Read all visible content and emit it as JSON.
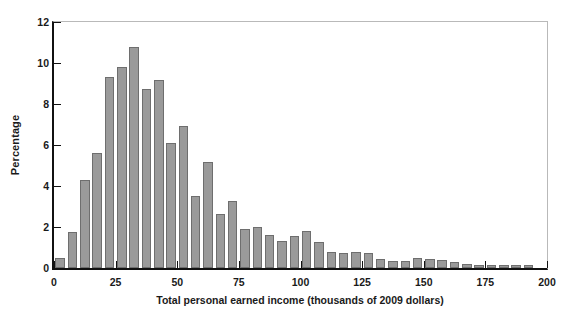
{
  "figure": {
    "caption": ""
  },
  "axes": {
    "ylabel": "Percentage",
    "xlabel": "Total personal earned income (thousands of 2009 dollars)",
    "yticks": [
      "0",
      "2",
      "4",
      "6",
      "8",
      "10",
      "12"
    ],
    "xticks": [
      "0",
      "25",
      "50",
      "75",
      "100",
      "125",
      "150",
      "175",
      "200"
    ]
  },
  "style": {
    "bar_fill": "#9a9a9a",
    "bar_edge": "#6e6e6e",
    "axis_color": "#111111",
    "frame_light": "#b9b9b9",
    "background": "#ffffff"
  },
  "chart_data": {
    "type": "bar",
    "title": "",
    "subtitle": "",
    "xlabel": "Total personal earned income (thousands of 2009 dollars)",
    "ylabel": "Percentage",
    "xlim": [
      0,
      200
    ],
    "ylim": [
      0,
      12
    ],
    "grid": false,
    "legend": null,
    "bin_width": 5,
    "bin_starts": [
      0,
      5,
      10,
      15,
      20,
      25,
      30,
      35,
      40,
      45,
      50,
      55,
      60,
      65,
      70,
      75,
      80,
      85,
      90,
      95,
      100,
      105,
      110,
      115,
      120,
      125,
      130,
      135,
      140,
      145,
      150,
      155,
      160,
      165,
      170,
      175,
      180,
      185,
      190,
      195
    ],
    "categories": [
      "0-5",
      "5-10",
      "10-15",
      "15-20",
      "20-25",
      "25-30",
      "30-35",
      "35-40",
      "40-45",
      "45-50",
      "50-55",
      "55-60",
      "60-65",
      "65-70",
      "70-75",
      "75-80",
      "80-85",
      "85-90",
      "90-95",
      "95-100",
      "100-105",
      "105-110",
      "110-115",
      "115-120",
      "120-125",
      "125-130",
      "130-135",
      "135-140",
      "140-145",
      "145-150",
      "150-155",
      "155-160",
      "160-165",
      "165-170",
      "170-175",
      "175-180",
      "180-185",
      "185-190",
      "190-195",
      "195-200"
    ],
    "values": [
      0.5,
      1.75,
      4.3,
      5.6,
      9.3,
      9.8,
      10.8,
      8.75,
      9.15,
      6.1,
      6.95,
      3.5,
      5.15,
      2.65,
      3.25,
      1.9,
      2.0,
      1.6,
      1.3,
      1.55,
      1.8,
      1.25,
      0.8,
      0.72,
      0.78,
      0.72,
      0.45,
      0.35,
      0.35,
      0.5,
      0.45,
      0.4,
      0.3,
      0.18,
      0.15,
      0.15,
      0.15,
      0.15,
      0.15,
      0.0
    ]
  }
}
